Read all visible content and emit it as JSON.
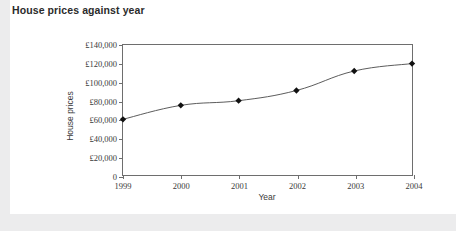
{
  "header": {
    "title": "House prices against year"
  },
  "chart_data": {
    "type": "line",
    "title": "House prices against year",
    "xlabel": "Year",
    "ylabel": "House prices",
    "categories": [
      "1999",
      "2000",
      "2001",
      "2002",
      "2003",
      "2004"
    ],
    "x": [
      1999,
      2000,
      2001,
      2002,
      2003,
      2004
    ],
    "values": [
      60000,
      75000,
      80000,
      91000,
      112000,
      120000
    ],
    "series": [
      {
        "name": "House prices",
        "values": [
          60000,
          75000,
          80000,
          91000,
          112000,
          120000
        ]
      }
    ],
    "ylim": [
      0,
      140000
    ],
    "xlim": [
      1999,
      2004
    ],
    "ytick_values": [
      0,
      20000,
      40000,
      60000,
      80000,
      100000,
      120000,
      140000
    ],
    "ytick_labels": [
      "0",
      "£20,000",
      "£40,000",
      "£60,000",
      "£80,000",
      "£100,000",
      "£120,000",
      "£140,000"
    ],
    "xtick_labels": [
      "1999",
      "2000",
      "2001",
      "2002",
      "2003",
      "2004"
    ],
    "grid": false,
    "legend": null,
    "marker": "diamond",
    "line_color": "#5a5a5a",
    "marker_color": "#111111",
    "axis_color": "#6e6e6e",
    "plot_background": "#ffffff",
    "page_background": "#ececed"
  }
}
